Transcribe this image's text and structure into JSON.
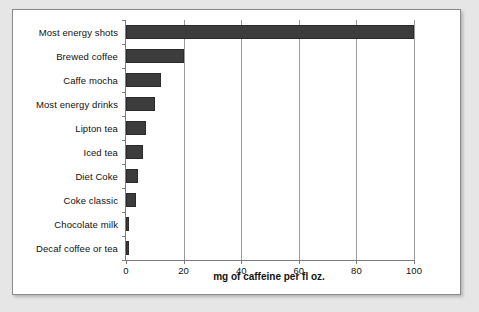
{
  "chart_data": {
    "type": "bar",
    "orientation": "horizontal",
    "title": "",
    "xlabel": "mg of caffeine per fl oz.",
    "ylabel": "",
    "xlim": [
      0,
      100
    ],
    "xticks": [
      0,
      20,
      40,
      60,
      80,
      100
    ],
    "xticklabels": [
      "0",
      "20",
      "40",
      "60",
      "80",
      "100"
    ],
    "grid": "vertical",
    "legend": "none",
    "bar_color": "#3c3c3c",
    "categories": [
      "Most energy shots",
      "Brewed coffee",
      "Caffe mocha",
      "Most energy drinks",
      "Lipton tea",
      "Iced tea",
      "Diet Coke",
      "Coke classic",
      "Chocolate milk",
      "Decaf coffee or tea"
    ],
    "values": [
      100,
      20,
      12,
      10,
      7,
      6,
      4,
      3.5,
      1,
      1
    ]
  },
  "panel": {
    "background": "#ffffff",
    "border_color": "#8a8a8a"
  }
}
